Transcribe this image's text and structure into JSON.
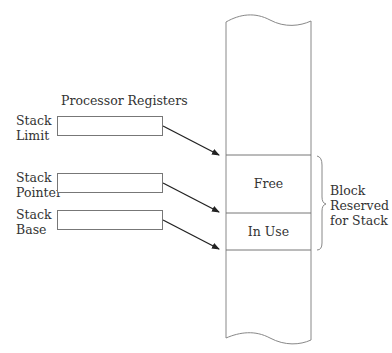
{
  "diagram": {
    "registers_title": "Processor Registers",
    "registers": [
      {
        "label_line1": "Stack",
        "label_line2": "Limit"
      },
      {
        "label_line1": "Stack",
        "label_line2": "Pointer"
      },
      {
        "label_line1": "Stack",
        "label_line2": "Base"
      }
    ],
    "memory": {
      "free_label": "Free",
      "in_use_label": "In Use"
    },
    "brace_label": {
      "line1": "Block",
      "line2": "Reserved",
      "line3": "for Stack"
    },
    "colors": {
      "line": "#777777",
      "arrow": "#222222",
      "text": "#333333"
    }
  }
}
